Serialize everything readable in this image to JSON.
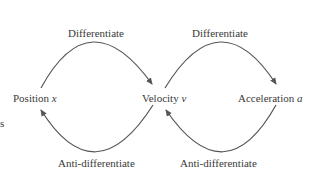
{
  "diagram": {
    "nodes": [
      {
        "id": "position",
        "label": "Position",
        "symbol": "x"
      },
      {
        "id": "velocity",
        "label": "Velocity",
        "symbol": "v"
      },
      {
        "id": "acceleration",
        "label": "Acceleration",
        "symbol": "a"
      }
    ],
    "edges": [
      {
        "from": "position",
        "to": "velocity",
        "label": "Differentiate"
      },
      {
        "from": "velocity",
        "to": "acceleration",
        "label": "Differentiate"
      },
      {
        "from": "acceleration",
        "to": "velocity",
        "label": "Anti-differentiate"
      },
      {
        "from": "velocity",
        "to": "position",
        "label": "Anti-differentiate"
      }
    ],
    "edge_color": "#555555",
    "side_fragment": "s"
  }
}
